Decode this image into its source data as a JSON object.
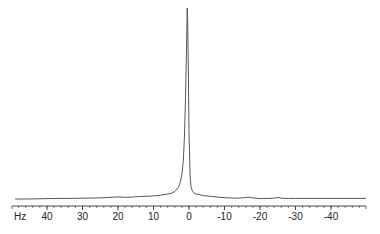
{
  "chart_data": {
    "type": "line",
    "title": "",
    "xlabel": "Hz",
    "ylabel": "",
    "x_reversed": true,
    "xlim": [
      49,
      -50
    ],
    "ylim": [
      0,
      1.05
    ],
    "grid": false,
    "legend": null,
    "x_ticks": [
      40,
      30,
      20,
      10,
      0,
      -10,
      -20,
      -30,
      -40
    ],
    "x_tick_labels": [
      "40",
      "30",
      "20",
      "10",
      "0",
      "-10",
      "-20",
      "-30",
      "-40"
    ],
    "minor_tick_step": 2,
    "colors": {
      "line": "#555555",
      "axis": "#444444",
      "text": "#222222"
    },
    "series": [
      {
        "name": "spectrum",
        "x": [
          49,
          45,
          40,
          35,
          30,
          25,
          22,
          20,
          18,
          16,
          14,
          12,
          10,
          8,
          6,
          5,
          4,
          3,
          2.5,
          2,
          1.6,
          1.3,
          1.0,
          0.8,
          0.6,
          0.5,
          0.4,
          0.2,
          0.0,
          -0.3,
          -0.6,
          -1,
          -1.5,
          -2,
          -3,
          -4,
          -6,
          -8,
          -10,
          -12,
          -14,
          -16,
          -17,
          -18,
          -20,
          -22,
          -24,
          -25,
          -26,
          -28,
          -30,
          -35,
          -40,
          -45,
          -50
        ],
        "y": [
          0.0,
          0.0,
          0.002,
          0.003,
          0.004,
          0.006,
          0.009,
          0.011,
          0.009,
          0.01,
          0.013,
          0.014,
          0.016,
          0.02,
          0.026,
          0.03,
          0.04,
          0.06,
          0.085,
          0.13,
          0.2,
          0.32,
          0.5,
          0.7,
          0.9,
          1.0,
          0.95,
          0.7,
          0.35,
          0.12,
          0.06,
          0.04,
          0.03,
          0.026,
          0.022,
          0.018,
          0.014,
          0.01,
          0.007,
          0.005,
          0.004,
          0.008,
          0.009,
          0.006,
          0.002,
          0.003,
          0.004,
          0.008,
          0.004,
          0.003,
          0.003,
          0.003,
          0.003,
          0.003,
          0.003
        ]
      }
    ]
  }
}
